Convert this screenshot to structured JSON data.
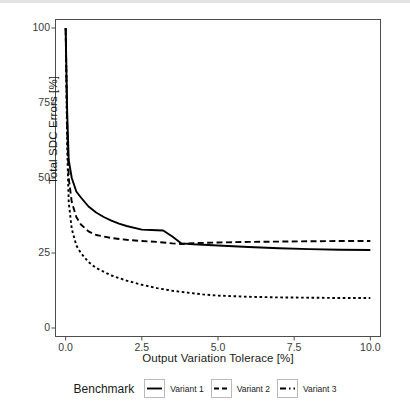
{
  "chart_data": {
    "type": "line",
    "title": "",
    "xlabel": "Output Variation Tolerace [%]",
    "ylabel": "Total SDC Errors [%]",
    "xlim": [
      -0.35,
      10.35
    ],
    "ylim": [
      -3,
      103
    ],
    "xticks": [
      0.0,
      2.5,
      5.0,
      7.5,
      10.0
    ],
    "xticklabels": [
      "0.0",
      "2.5",
      "5.0",
      "7.5",
      "10.0"
    ],
    "yticks": [
      0,
      25,
      50,
      75,
      100
    ],
    "yticklabels": [
      "0",
      "25",
      "50",
      "75",
      "100"
    ],
    "grid": false,
    "legend": {
      "title": "Benchmark",
      "position": "bottom",
      "entries": [
        {
          "label": "Variant 1",
          "dash": "solid"
        },
        {
          "label": "Variant 2",
          "dash": "dashed"
        },
        {
          "label": "Variant 3",
          "dash": "dotted"
        }
      ]
    },
    "series": [
      {
        "name": "Variant 1",
        "dash": "solid",
        "color": "#000000",
        "x": [
          0.0,
          0.05,
          0.1,
          0.2,
          0.35,
          0.5,
          0.75,
          1.0,
          1.25,
          1.5,
          1.75,
          2.0,
          2.5,
          3.0,
          3.2,
          3.5,
          3.8,
          4.2,
          5.0,
          6.0,
          7.0,
          8.0,
          9.0,
          10.0
        ],
        "y": [
          100.0,
          72.0,
          56.0,
          50.0,
          45.5,
          43.5,
          40.5,
          38.5,
          37.0,
          35.8,
          34.8,
          34.0,
          32.8,
          32.6,
          32.5,
          30.5,
          28.2,
          27.9,
          27.5,
          27.0,
          26.6,
          26.3,
          26.1,
          26.0
        ]
      },
      {
        "name": "Variant 2",
        "dash": "dashed",
        "color": "#000000",
        "x": [
          0.0,
          0.05,
          0.1,
          0.2,
          0.35,
          0.5,
          0.75,
          1.0,
          1.5,
          2.0,
          2.5,
          3.0,
          3.5,
          3.8,
          4.2,
          5.0,
          6.0,
          7.0,
          8.0,
          9.0,
          10.0
        ],
        "y": [
          100.0,
          66.0,
          50.0,
          42.0,
          37.0,
          34.5,
          32.2,
          31.0,
          30.0,
          29.4,
          29.0,
          28.7,
          28.2,
          28.0,
          28.3,
          28.5,
          28.7,
          28.8,
          28.9,
          29.0,
          29.0
        ]
      },
      {
        "name": "Variant 3",
        "dash": "dotted",
        "color": "#000000",
        "x": [
          0.0,
          0.05,
          0.1,
          0.2,
          0.35,
          0.5,
          0.75,
          1.0,
          1.5,
          2.0,
          2.5,
          3.0,
          3.5,
          4.0,
          4.5,
          5.0,
          6.0,
          7.0,
          8.0,
          9.0,
          10.0
        ],
        "y": [
          100.0,
          60.0,
          42.0,
          33.0,
          27.5,
          25.0,
          22.0,
          20.0,
          17.5,
          15.8,
          14.4,
          13.3,
          12.4,
          11.8,
          11.2,
          10.8,
          10.4,
          10.2,
          10.1,
          10.0,
          10.0
        ]
      }
    ]
  },
  "panel": {
    "border_color": "#4d4d4d",
    "background": "#ffffff",
    "left": 55,
    "top": 19,
    "right": 381,
    "bottom": 337
  }
}
